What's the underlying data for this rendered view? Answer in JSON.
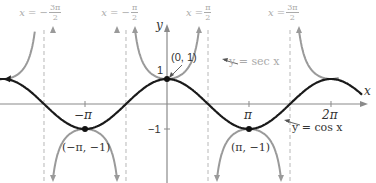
{
  "figure": {
    "axes": {
      "x_label": "x",
      "y_label": "y",
      "x_ticks": [
        {
          "label": "−π",
          "value": -3.14159
        },
        {
          "label": "π",
          "value": 3.14159
        },
        {
          "label": "2π",
          "value": 6.28318
        }
      ],
      "y_ticks": [
        {
          "label": "1",
          "value": 1
        },
        {
          "label": "−1",
          "value": -1
        }
      ]
    },
    "asymptotes": [
      {
        "label_left": "x = −",
        "num": "3π",
        "den": "2",
        "value": -4.71239
      },
      {
        "label_left": "x = −",
        "num": "π",
        "den": "2",
        "value": -1.5708
      },
      {
        "label_left": "x = ",
        "num": "π",
        "den": "2",
        "value": 1.5708
      },
      {
        "label_left": "x = ",
        "num": "3π",
        "den": "2",
        "value": 4.71239
      }
    ],
    "points": [
      {
        "label": "(0, 1)",
        "x": 0,
        "y": 1
      },
      {
        "label": "(−π, −1)",
        "x": -3.14159,
        "y": -1
      },
      {
        "label": "(π, −1)",
        "x": 3.14159,
        "y": -1
      }
    ],
    "curves": {
      "sec_label": "y = sec x",
      "cos_label": "y = cos x",
      "sec_color": "#9a9a9a",
      "cos_color": "#1a1a1a",
      "asymptote_color": "#b8b8b8",
      "axis_color": "#8a8a8a"
    }
  }
}
